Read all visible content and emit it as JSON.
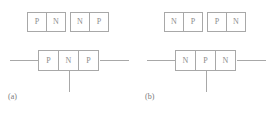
{
  "figure": {
    "colors": {
      "background": "#ffffff",
      "stroke": "#a8a8a8",
      "label_text": "#8c8c8c",
      "caption_text": "#7a7a7a"
    },
    "panels": [
      {
        "id": "a",
        "caption": "(a)",
        "device_type": "PNP",
        "junction_pairs": [
          {
            "id": "a-left",
            "regions": [
              "P",
              "N"
            ]
          },
          {
            "id": "a-right",
            "regions": [
              "N",
              "P"
            ]
          }
        ],
        "transistor": {
          "regions": [
            "P",
            "N",
            "P"
          ],
          "terminals": [
            "collector-lead",
            "base-lead",
            "emitter-lead"
          ]
        }
      },
      {
        "id": "b",
        "caption": "(b)",
        "device_type": "NPN",
        "junction_pairs": [
          {
            "id": "b-left",
            "regions": [
              "N",
              "P"
            ]
          },
          {
            "id": "b-right",
            "regions": [
              "P",
              "N"
            ]
          }
        ],
        "transistor": {
          "regions": [
            "N",
            "P",
            "N"
          ],
          "terminals": [
            "collector-lead",
            "base-lead",
            "emitter-lead"
          ]
        }
      }
    ]
  }
}
